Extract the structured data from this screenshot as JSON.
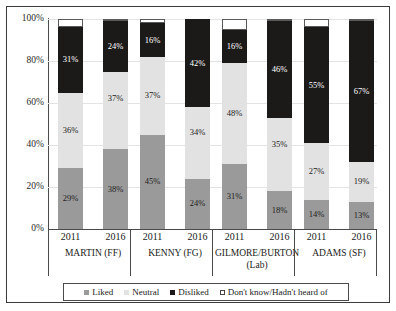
{
  "chart_data": {
    "type": "bar",
    "subtype": "stacked-bar-100",
    "title": "",
    "xlabel": "",
    "ylabel": "",
    "ylim": [
      0,
      100
    ],
    "ytick_labels": [
      "0%",
      "20%",
      "40%",
      "60%",
      "80%",
      "100%"
    ],
    "ytick_values": [
      0,
      20,
      40,
      60,
      80,
      100
    ],
    "grid": true,
    "legend_position": "bottom",
    "categories": [
      "2011",
      "2016",
      "2011",
      "2016",
      "2011",
      "2016",
      "2011",
      "2016"
    ],
    "groups": [
      {
        "name": "MARTIN (FF)",
        "line2": "",
        "years": [
          "2011",
          "2016"
        ]
      },
      {
        "name": "KENNY (FG)",
        "line2": "",
        "years": [
          "2011",
          "2016"
        ]
      },
      {
        "name": "GILMORE/BURTON",
        "line2": "(Lab)",
        "years": [
          "2011",
          "2016"
        ]
      },
      {
        "name": "ADAMS (SF)",
        "line2": "",
        "years": [
          "2011",
          "2016"
        ]
      }
    ],
    "series": [
      {
        "name": "Liked",
        "color": "#9a9a9a",
        "values": [
          29,
          38,
          45,
          24,
          31,
          18,
          14,
          13
        ]
      },
      {
        "name": "Neutral",
        "color": "#e2e2e2",
        "values": [
          36,
          37,
          37,
          34,
          48,
          35,
          27,
          19
        ]
      },
      {
        "name": "Disliked",
        "color": "#1c1a19",
        "values": [
          31,
          24,
          16,
          42,
          16,
          46,
          55,
          67
        ]
      },
      {
        "name": "Don't know/Hadn't heard of",
        "color": "#ffffff",
        "values": [
          4,
          1,
          2,
          0,
          5,
          1,
          4,
          1
        ]
      }
    ],
    "bars": [
      {
        "group": "MARTIN (FF)",
        "year": "2011",
        "liked": "29%",
        "neutral": "36%",
        "disliked": "31%",
        "dontknow": ""
      },
      {
        "group": "MARTIN (FF)",
        "year": "2016",
        "liked": "38%",
        "neutral": "37%",
        "disliked": "24%",
        "dontknow": ""
      },
      {
        "group": "KENNY (FG)",
        "year": "2011",
        "liked": "45%",
        "neutral": "37%",
        "disliked": "16%",
        "dontknow": ""
      },
      {
        "group": "KENNY (FG)",
        "year": "2016",
        "liked": "24%",
        "neutral": "34%",
        "disliked": "42%",
        "dontknow": ""
      },
      {
        "group": "GILMORE/BURTON",
        "year": "2011",
        "liked": "31%",
        "neutral": "48%",
        "disliked": "16%",
        "dontknow": ""
      },
      {
        "group": "GILMORE/BURTON",
        "year": "2016",
        "liked": "18%",
        "neutral": "35%",
        "disliked": "46%",
        "dontknow": ""
      },
      {
        "group": "ADAMS (SF)",
        "year": "2011",
        "liked": "14%",
        "neutral": "27%",
        "disliked": "55%",
        "dontknow": ""
      },
      {
        "group": "ADAMS (SF)",
        "year": "2016",
        "liked": "13%",
        "neutral": "19%",
        "disliked": "67%",
        "dontknow": ""
      }
    ],
    "legend": [
      {
        "label": "Liked",
        "color": "#9a9a9a"
      },
      {
        "label": "Neutral",
        "color": "#e2e2e2"
      },
      {
        "label": "Disliked",
        "color": "#1c1a19"
      },
      {
        "label": "Don't know/Hadn't heard of",
        "color": "#ffffff"
      }
    ]
  }
}
